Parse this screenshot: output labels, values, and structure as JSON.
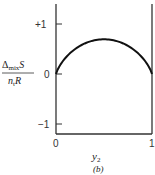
{
  "chart_data": {
    "type": "line",
    "title": "",
    "subtitle": "(b)",
    "xlabel": "y2",
    "ylabel": "Δmix S / n_t R",
    "xlim": [
      0,
      1
    ],
    "ylim": [
      -1.2,
      1.4
    ],
    "x_ticks": [
      "0",
      "1"
    ],
    "y_ticks": [
      "+1",
      "0",
      "-1"
    ],
    "grid": false,
    "legend": null,
    "series": [
      {
        "name": "ideal entropy of mixing",
        "x": [
          0.0,
          0.05,
          0.1,
          0.2,
          0.3,
          0.4,
          0.5,
          0.6,
          0.7,
          0.8,
          0.9,
          0.95,
          1.0
        ],
        "values": [
          0.0,
          0.199,
          0.325,
          0.5,
          0.611,
          0.673,
          0.693,
          0.673,
          0.611,
          0.5,
          0.325,
          0.199,
          0.0
        ]
      }
    ]
  },
  "labels": {
    "ylabel_num_main": "Δ",
    "ylabel_num_sub": "mix",
    "ylabel_num_tail": "S",
    "ylabel_den_main": "n",
    "ylabel_den_sub": "t",
    "ylabel_den_tail": "R",
    "xlabel_main": "y",
    "xlabel_sub": "2",
    "panel": "(b)",
    "ytick_plus1": "+1",
    "ytick_0": "0",
    "ytick_minus1": "−1",
    "xtick_0": "0",
    "xtick_1": "1"
  }
}
